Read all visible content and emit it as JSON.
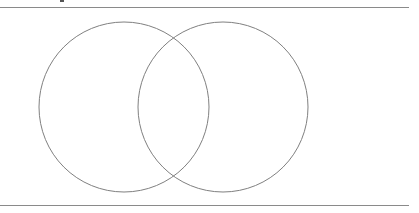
{
  "diagram": {
    "type": "venn",
    "sets": [
      {
        "id": "left",
        "cx": 124,
        "cy": 107,
        "r": 85
      },
      {
        "id": "right",
        "cx": 223,
        "cy": 107,
        "r": 85
      }
    ],
    "stroke_color": "#808080",
    "rule_color": "#8a8a8a"
  }
}
